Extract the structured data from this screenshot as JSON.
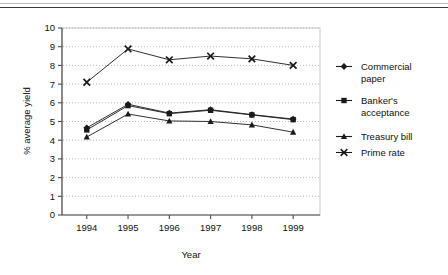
{
  "chart_data": {
    "type": "line",
    "title": "",
    "xlabel": "Year",
    "ylabel": "% average yield",
    "categories": [
      "1994",
      "1995",
      "1996",
      "1997",
      "1998",
      "1999"
    ],
    "ylim": [
      0,
      10
    ],
    "yticks": [
      "0",
      "1",
      "2",
      "3",
      "4",
      "5",
      "6",
      "7",
      "8",
      "9",
      "10"
    ],
    "grid": "horizontal-dotted",
    "legend_position": "right",
    "series": [
      {
        "name": "Commercial paper",
        "marker": "diamond",
        "values": [
          4.66,
          5.92,
          5.45,
          5.63,
          5.37,
          5.13
        ]
      },
      {
        "name": "Banker's acceptance",
        "marker": "square",
        "values": [
          4.55,
          5.85,
          5.42,
          5.6,
          5.35,
          5.1
        ]
      },
      {
        "name": "Treasury bill",
        "marker": "triangle",
        "values": [
          4.17,
          5.4,
          5.03,
          5.0,
          4.82,
          4.43
        ]
      },
      {
        "name": "Prime rate",
        "marker": "x",
        "values": [
          7.1,
          8.88,
          8.3,
          8.5,
          8.35,
          8.0
        ]
      }
    ]
  },
  "legend": {
    "items": [
      {
        "line1": "Commercial",
        "line2": "paper",
        "marker": "diamond-marker-icon"
      },
      {
        "line1": "Banker's",
        "line2": "acceptance",
        "marker": "square-marker-icon"
      },
      {
        "line1": "Treasury bill",
        "line2": "",
        "marker": "triangle-marker-icon"
      },
      {
        "line1": "Prime rate",
        "line2": "",
        "marker": "x-marker-icon"
      }
    ]
  },
  "colors": {
    "series": "#1a1a1a",
    "grid": "#a9a9a9",
    "axis": "#4d4d4d",
    "plot_border": "#c9c9c9",
    "text": "#111111"
  }
}
